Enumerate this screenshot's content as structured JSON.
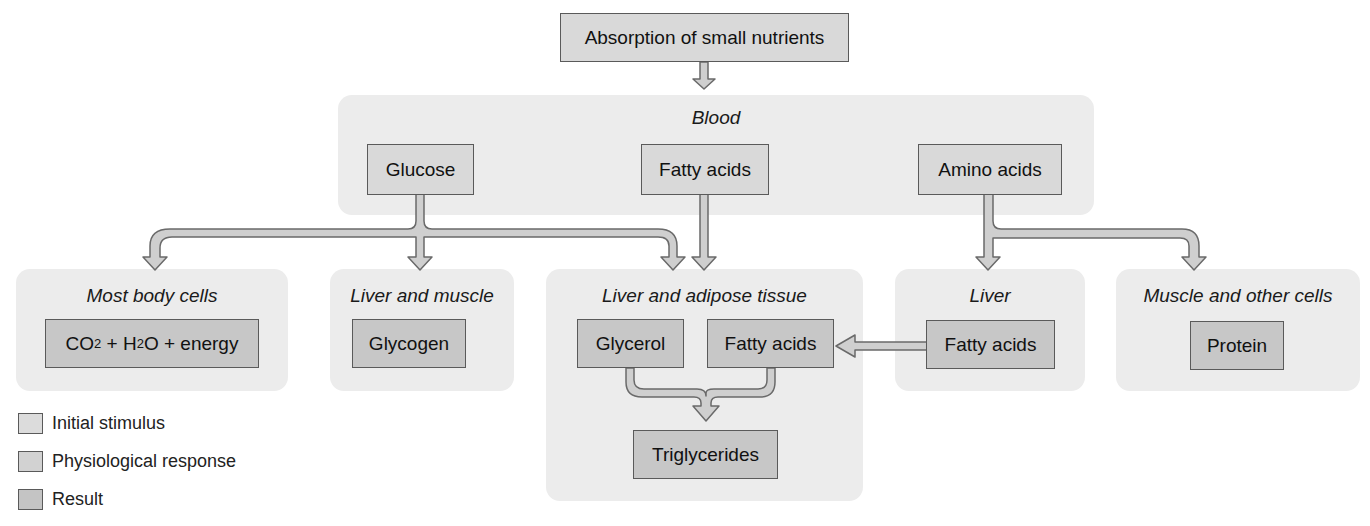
{
  "diagram": {
    "top": {
      "label": "Absorption of small nutrients"
    },
    "blood": {
      "title": "Blood",
      "nodes": {
        "glucose": "Glucose",
        "fatty_acids": "Fatty acids",
        "amino_acids": "Amino acids"
      }
    },
    "destinations": {
      "most_body_cells": {
        "title": "Most body cells",
        "co2": "CO",
        "co2_sub": "2",
        "plus_h": " + H",
        "h2o_sub": "2",
        "o_energy": "O + energy"
      },
      "liver_and_muscle": {
        "title": "Liver and muscle",
        "result": "Glycogen"
      },
      "liver_and_adipose": {
        "title": "Liver and adipose tissue",
        "glycerol": "Glycerol",
        "fatty_acids": "Fatty acids",
        "result": "Triglycerides"
      },
      "liver": {
        "title": "Liver",
        "result": "Fatty acids"
      },
      "muscle_other": {
        "title": "Muscle and other cells",
        "result": "Protein"
      }
    },
    "legend": [
      {
        "label": "Initial stimulus",
        "color": "#dcdcdc"
      },
      {
        "label": "Physiological response",
        "color": "#d2d2d2"
      },
      {
        "label": "Result",
        "color": "#c4c4c4"
      }
    ],
    "colors": {
      "region": "#ececec",
      "stimulus_box": "#d9d9d9",
      "result_box": "#c7c7c7",
      "arrow_fill": "#cfcfcf",
      "arrow_stroke": "#6a6a6a"
    }
  }
}
